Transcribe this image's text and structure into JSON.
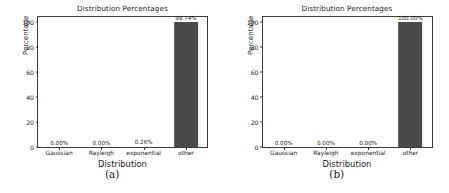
{
  "figure": {
    "panels": [
      {
        "caption": "(a)",
        "title": "Distribution Percentages",
        "xlabel": "Distribution",
        "ylabel": "Percentage"
      },
      {
        "caption": "(b)",
        "title": "Distribution Percentages",
        "xlabel": "Distribution",
        "ylabel": "Percentage"
      }
    ],
    "colors": {
      "bar": "#4a4a4a",
      "axis": "#3b3b3b",
      "text": "#1a1a1a",
      "background": "#ffffff"
    }
  },
  "chart_data": [
    {
      "type": "bar",
      "panel": "(a)",
      "title": "Distribution Percentages",
      "xlabel": "Distribution",
      "ylabel": "Percentage",
      "categories": [
        "Gaussian",
        "Rayleigh",
        "exponential",
        "other"
      ],
      "values": [
        0.0,
        0.0,
        0.26,
        99.74
      ],
      "data_labels": [
        "0.00%",
        "0.00%",
        "0.26%",
        "99.74%"
      ],
      "yticks": [
        0,
        20,
        40,
        60,
        80,
        100
      ],
      "ytick_labels": [
        "0",
        "20",
        "40",
        "60",
        "80",
        "100"
      ],
      "ylim": [
        0,
        104
      ],
      "grid": false,
      "legend": false
    },
    {
      "type": "bar",
      "panel": "(b)",
      "title": "Distribution Percentages",
      "xlabel": "Distribution",
      "ylabel": "Percentage",
      "categories": [
        "Gaussian",
        "Rayleigh",
        "exponential",
        "other"
      ],
      "values": [
        0.0,
        0.0,
        0.0,
        100.0
      ],
      "data_labels": [
        "0.00%",
        "0.00%",
        "0.00%",
        "100.00%"
      ],
      "yticks": [
        0,
        20,
        40,
        60,
        80,
        100
      ],
      "ytick_labels": [
        "0",
        "20",
        "40",
        "60",
        "80",
        "100"
      ],
      "ylim": [
        0,
        104
      ],
      "grid": false,
      "legend": false
    }
  ]
}
